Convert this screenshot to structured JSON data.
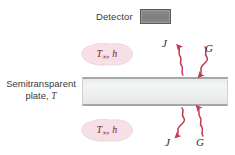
{
  "figure": {
    "background_color": "#ffffff",
    "width": 235,
    "height": 155
  },
  "detector": {
    "label": "Detector",
    "box_fill": "#808080",
    "box_border": "#5a5a5a"
  },
  "plate": {
    "caption_line1": "Semitransparent",
    "caption_line2_prefix": "plate, ",
    "caption_symbol": "T",
    "fill": "#eceded",
    "edge": "#a4a8a9"
  },
  "convection": {
    "top": {
      "temp_symbol": "T",
      "temp_subscript": "∞",
      "separator": ", ",
      "coeff_symbol": "h"
    },
    "bottom": {
      "temp_symbol": "T",
      "temp_subscript": "∞",
      "separator": ", ",
      "coeff_symbol": "h"
    },
    "blob_fill": "#f7dfe6",
    "text_color": "#7b2230"
  },
  "radiation": {
    "arrow_color": "#c0394f",
    "top": {
      "outgoing_label": "J",
      "incoming_label": "G"
    },
    "bottom": {
      "outgoing_label": "J",
      "incoming_label": "G"
    }
  }
}
